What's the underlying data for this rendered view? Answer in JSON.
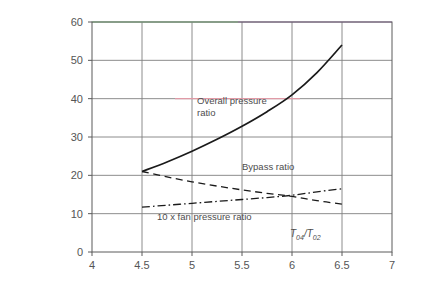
{
  "chart_data": {
    "type": "line",
    "title": "",
    "subtitle": "",
    "xlabel": "T04/T02",
    "xlabel_base": "T",
    "xlabel_sub1": "04",
    "xlabel_slash": "/",
    "xlabel_base2": "T",
    "xlabel_sub2": "02",
    "ylabel": "",
    "xlim": [
      4,
      7
    ],
    "ylim": [
      0,
      60
    ],
    "xticks": [
      4,
      4.5,
      5,
      5.5,
      6,
      6.5,
      7
    ],
    "xtick_labels": [
      "4",
      "4.5",
      "5",
      "5.5",
      "6",
      "6.5",
      "7"
    ],
    "yticks": [
      0,
      10,
      20,
      30,
      40,
      50,
      60
    ],
    "ytick_labels": [
      "0",
      "10",
      "20",
      "30",
      "40",
      "50",
      "60"
    ],
    "grid": true,
    "grid_color": "#808080",
    "frame_color": "#5a5a5a",
    "legend_position": "inline-annotations",
    "series": [
      {
        "name": "Overall pressure ratio",
        "label": "Overall pressure ratio",
        "label_line1": "Overall pressure",
        "label_line2": "ratio",
        "style": "solid",
        "color": "#1a1a1a",
        "x": [
          4.5,
          4.75,
          5.0,
          5.25,
          5.5,
          5.75,
          6.0,
          6.25,
          6.5
        ],
        "values": [
          21.0,
          23.5,
          26.3,
          29.4,
          32.8,
          36.6,
          41.0,
          46.8,
          54.0
        ]
      },
      {
        "name": "Bypass ratio",
        "label": "Bypass ratio",
        "style": "dashed",
        "color": "#1a1a1a",
        "x": [
          4.5,
          4.75,
          5.0,
          5.25,
          5.5,
          5.75,
          6.0,
          6.25,
          6.5
        ],
        "values": [
          21.0,
          19.6,
          18.3,
          17.2,
          16.2,
          15.3,
          14.5,
          13.4,
          12.5
        ]
      },
      {
        "name": "10 x fan pressure ratio",
        "label": "10 x fan pressure ratio",
        "style": "dash-dot",
        "color": "#1a1a1a",
        "x": [
          4.5,
          4.75,
          5.0,
          5.25,
          5.5,
          5.75,
          6.0,
          6.25,
          6.5
        ],
        "values": [
          11.7,
          12.2,
          12.7,
          13.2,
          13.7,
          14.2,
          14.8,
          15.7,
          16.5
        ]
      }
    ],
    "annotations": [
      {
        "name": "overall-pressure-ratio-annotation",
        "text": "Overall pressure ratio",
        "x": 5.05,
        "y": 38.5
      },
      {
        "name": "bypass-ratio-annotation",
        "text": "Bypass ratio",
        "x": 5.5,
        "y": 21.5
      },
      {
        "name": "fan-pressure-ratio-annotation",
        "text": "10 x fan pressure ratio",
        "x": 4.65,
        "y": 8.4
      }
    ],
    "accent_colors": {
      "top_border_left": "#9fd6a0",
      "top_border_right": "#9b6fb0",
      "gridline_40_right": "#e09aa6"
    }
  }
}
